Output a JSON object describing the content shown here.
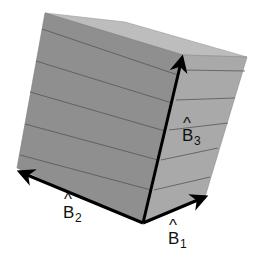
{
  "diagram": {
    "title": "",
    "colors": {
      "left_face": "#8f8f8f",
      "right_face": "#a9a9a9",
      "top_face": "#bdbdbd",
      "stripe": "#555555",
      "arrow": "#000000",
      "background": "#ffffff"
    },
    "vectors": [
      {
        "id": "B1",
        "base": "B",
        "hat": "^",
        "subscript": "1",
        "direction": "right-front"
      },
      {
        "id": "B2",
        "base": "B",
        "hat": "^",
        "subscript": "2",
        "direction": "left-front"
      },
      {
        "id": "B3",
        "base": "B",
        "hat": "^",
        "subscript": "3",
        "direction": "up"
      }
    ]
  }
}
